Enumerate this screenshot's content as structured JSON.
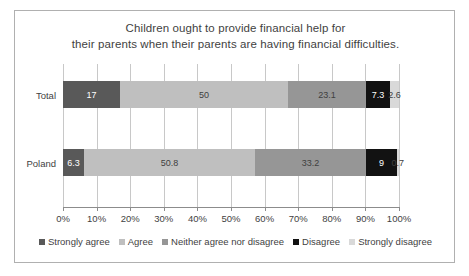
{
  "chart_data": {
    "type": "bar",
    "orientation": "horizontal",
    "stacked": true,
    "normalized": true,
    "title": "Children ought to provide financial help for their parents when their parents are having financial difficulties.",
    "title_lines": [
      "Children ought to provide financial help for",
      "their parents when their parents are having financial difficulties."
    ],
    "xlabel": "",
    "ylabel": "",
    "categories": [
      "Total",
      "Poland"
    ],
    "xlim": [
      0,
      100
    ],
    "xtick_labels": [
      "0%",
      "10%",
      "20%",
      "30%",
      "40%",
      "50%",
      "60%",
      "70%",
      "80%",
      "90%",
      "100%"
    ],
    "xtick_values": [
      0,
      10,
      20,
      30,
      40,
      50,
      60,
      70,
      80,
      90,
      100
    ],
    "grid": true,
    "grid_axis": "x",
    "legend_position": "bottom",
    "series": [
      {
        "name": "Strongly agree",
        "color": "#595959",
        "text_color": "#ffffff",
        "values": [
          17,
          6.3
        ],
        "labels": [
          "17",
          "6.3"
        ]
      },
      {
        "name": "Agree",
        "color": "#bfbfbf",
        "text_color": "#404040",
        "values": [
          50,
          50.8
        ],
        "labels": [
          "50",
          "50.8"
        ]
      },
      {
        "name": "Neither agree nor disagree",
        "color": "#969696",
        "text_color": "#404040",
        "values": [
          23.1,
          33.2
        ],
        "labels": [
          "23.1",
          "33.2"
        ]
      },
      {
        "name": "Disagree",
        "color": "#121212",
        "text_color": "#ffffff",
        "values": [
          7.3,
          9
        ],
        "labels": [
          "7.3",
          "9"
        ]
      },
      {
        "name": "Strongly disagree",
        "color": "#d9d9d9",
        "text_color": "#404040",
        "values": [
          2.6,
          0.7
        ],
        "labels": [
          "2.6",
          "0.7"
        ]
      }
    ]
  },
  "chart": {
    "title_line_1": "Children ought to provide financial help for",
    "title_line_2": "their parents when their parents are having financial difficulties.",
    "rows": [
      {
        "category": "Total",
        "segments": [
          {
            "label": "17",
            "value": 17,
            "series": "Strongly agree"
          },
          {
            "label": "50",
            "value": 50,
            "series": "Agree"
          },
          {
            "label": "23.1",
            "value": 23.1,
            "series": "Neither agree nor disagree"
          },
          {
            "label": "7.3",
            "value": 7.3,
            "series": "Disagree"
          },
          {
            "label": "2.6",
            "value": 2.6,
            "series": "Strongly disagree"
          }
        ]
      },
      {
        "category": "Poland",
        "segments": [
          {
            "label": "6.3",
            "value": 6.3,
            "series": "Strongly agree"
          },
          {
            "label": "50.8",
            "value": 50.8,
            "series": "Agree"
          },
          {
            "label": "33.2",
            "value": 33.2,
            "series": "Neither agree nor disagree"
          },
          {
            "label": "9",
            "value": 9,
            "series": "Disagree"
          },
          {
            "label": "0.7",
            "value": 0.7,
            "series": "Strongly disagree"
          }
        ]
      }
    ],
    "axis": {
      "ticks": [
        "0%",
        "10%",
        "20%",
        "30%",
        "40%",
        "50%",
        "60%",
        "70%",
        "80%",
        "90%",
        "100%"
      ]
    },
    "legend": [
      {
        "label": "Strongly agree",
        "color": "#595959"
      },
      {
        "label": "Agree",
        "color": "#bfbfbf"
      },
      {
        "label": "Neither agree nor disagree",
        "color": "#969696"
      },
      {
        "label": "Disagree",
        "color": "#121212"
      },
      {
        "label": "Strongly disagree",
        "color": "#d9d9d9"
      }
    ]
  }
}
